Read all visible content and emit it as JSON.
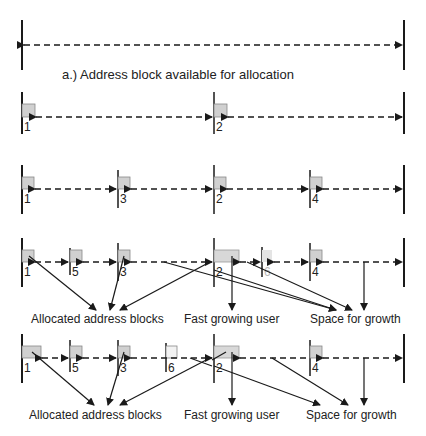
{
  "caption_a": "a.) Address block available for allocation",
  "rows": {
    "row2": {
      "labels": [
        "1",
        "2"
      ]
    },
    "row3": {
      "labels": [
        "1",
        "3",
        "2",
        "4"
      ]
    },
    "row4": {
      "labels": [
        "1",
        "5",
        "3",
        "2",
        "6",
        "4"
      ],
      "annotations": [
        "Allocated address blocks",
        "Fast growing user",
        "Space for growth"
      ]
    },
    "row5": {
      "labels": [
        "1",
        "5",
        "3",
        "6",
        "2",
        "4"
      ],
      "annotations": [
        "Allocated address blocks",
        "Fast growing user",
        "Space for growth"
      ]
    }
  },
  "colors": {
    "block_fill": "#d0d0d0",
    "line": "#1a1a1a",
    "faded": "#b8b8b8"
  }
}
